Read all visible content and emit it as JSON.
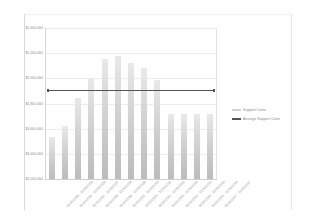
{
  "chart_data": {
    "type": "bar",
    "title": "",
    "xlabel": "",
    "ylabel": "",
    "ylim": [
      4200000,
      5400000
    ],
    "ytick_values": [
      5400000,
      5200000,
      5000000,
      4800000,
      4600000,
      4400000,
      4200000
    ],
    "ytick_labels": [
      "$5,400,000",
      "$5,200,000",
      "$5,000,000",
      "$4,800,000",
      "$4,600,000",
      "$4,400,000",
      "$4,200,000"
    ],
    "grid": true,
    "legend_position": "right",
    "categories": [
      "01/01/2005 - 12/31/2005",
      "01/01/2006 - 12/31/2006",
      "01/01/2007 - 12/31/2007",
      "01/01/2008 - 12/31/2008",
      "01/01/2009 - 12/31/2009",
      "01/01/2010 - 12/31/2010",
      "01/01/2011 - 12/31/2011",
      "01/01/2012 - 12/31/2012",
      "01/01/2013 - 12/31/2013",
      "01/01/2014 - 12/31/2014",
      "01/01/2015 - 12/31/2015",
      "01/01/2016 - 12/31/2016",
      "01/01/2017 - 12/31/2017"
    ],
    "series": [
      {
        "name": "Support Costs",
        "type": "bar",
        "color": "#d2d2d2",
        "values": [
          4530000,
          4620000,
          4845000,
          5000000,
          5155000,
          5180000,
          5120000,
          5085000,
          4990000,
          4720000,
          4720000,
          4720000,
          4720000
        ]
      },
      {
        "name": "Average Support Costs",
        "type": "line",
        "color": "#555555",
        "value": 4910000,
        "values": [
          4910000,
          4910000,
          4910000,
          4910000,
          4910000,
          4910000,
          4910000,
          4910000,
          4910000,
          4910000,
          4910000,
          4910000,
          4910000
        ]
      }
    ]
  },
  "legend": {
    "entries": [
      {
        "label": "Support Costs",
        "swatch": "bars"
      },
      {
        "label": "Average Support Costs",
        "swatch": "avg"
      }
    ]
  }
}
